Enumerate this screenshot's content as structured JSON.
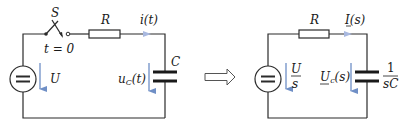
{
  "colors": {
    "wire": "#2b2b2b",
    "arrow": "#6f8fc6",
    "background": "#ffffff"
  },
  "time_domain": {
    "switch_label": "S",
    "switch_time_label": "t = 0",
    "resistor_label": "R",
    "current_label": "i(t)",
    "source_voltage_label": "U",
    "capacitor_label": "C",
    "capacitor_voltage_label": "u",
    "capacitor_voltage_sub": "C",
    "capacitor_voltage_arg": "(t)"
  },
  "transform_arrow": {
    "icon": "hollow-right-arrow"
  },
  "s_domain": {
    "resistor_label": "R",
    "current_label": "I(s)",
    "source_voltage_num": "U",
    "source_voltage_den": "s",
    "capacitor_voltage_label": "U",
    "capacitor_voltage_sub": "c",
    "capacitor_voltage_arg": "(s)",
    "impedance_num": "1",
    "impedance_den": "sC"
  }
}
